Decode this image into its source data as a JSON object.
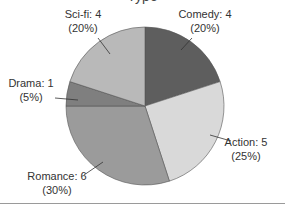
{
  "chart_data": {
    "type": "pie",
    "title": "Type",
    "slices": [
      {
        "label": "Comedy",
        "value": 4,
        "percent": "20%",
        "color": "#5e5e5e"
      },
      {
        "label": "Action",
        "value": 5,
        "percent": "25%",
        "color": "#d9d9d9"
      },
      {
        "label": "Romance",
        "value": 6,
        "percent": "30%",
        "color": "#9b9b9b"
      },
      {
        "label": "Drama",
        "value": 1,
        "percent": "5%",
        "color": "#7f7f7f"
      },
      {
        "label": "Sci-fi",
        "value": 4,
        "percent": "20%",
        "color": "#b9b9b9"
      }
    ],
    "start_angle": "top (12 o'clock)",
    "direction": "clockwise",
    "label_format": "{label}: {value} ({percent})"
  }
}
